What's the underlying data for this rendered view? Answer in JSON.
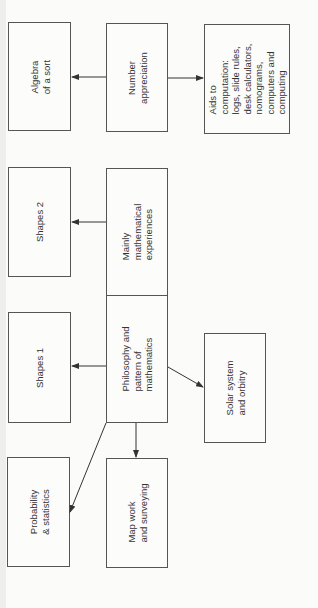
{
  "diagram": {
    "orientation": "rotated -90deg",
    "nodes": [
      {
        "id": "algebra",
        "label": "Algebra\nof a sort"
      },
      {
        "id": "number",
        "label": "Number\nappreciation"
      },
      {
        "id": "aids",
        "label": "Aids to\ncomputation:\nlogs, slide rules,\ndesk calculators,\nnomograms,\ncomputers and\ncomputing"
      },
      {
        "id": "shapes2",
        "label": "Shapes 2"
      },
      {
        "id": "mainly",
        "label": "Mainly\nmathematical\nexperiences"
      },
      {
        "id": "shapes1",
        "label": "Shapes 1"
      },
      {
        "id": "philosophy",
        "label": "Philosophy and\npattern of\nmathematics"
      },
      {
        "id": "solar",
        "label": "Solar system\nand orbitry"
      },
      {
        "id": "probability",
        "label": "Probability\n& statistics"
      },
      {
        "id": "mapwork",
        "label": "Map work\nand surveying"
      }
    ],
    "edges": [
      {
        "from": "number",
        "to": "algebra"
      },
      {
        "from": "number",
        "to": "aids"
      },
      {
        "from": "mainly",
        "to": "shapes2"
      },
      {
        "from": "philosophy",
        "to": "shapes1"
      },
      {
        "from": "philosophy",
        "to": "solar"
      },
      {
        "from": "philosophy",
        "to": "mapwork"
      },
      {
        "from": "philosophy",
        "to": "probability"
      }
    ],
    "colors": {
      "line": "#333333",
      "box_border": "#555555",
      "background": "#fbfbfa"
    }
  }
}
